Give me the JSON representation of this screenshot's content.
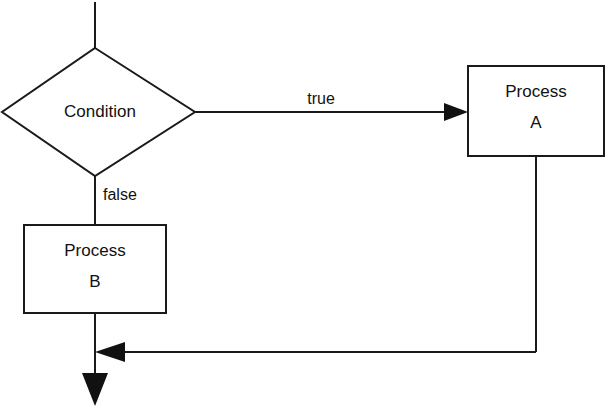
{
  "diagram": {
    "type": "flowchart",
    "colors": {
      "background": "#ffffff",
      "stroke": "#1a1a1a",
      "text": "#111111",
      "fill": "#ffffff"
    },
    "nodes": [
      {
        "id": "condition",
        "shape": "diamond",
        "label": "Condition",
        "lines": [
          "Condition"
        ],
        "center": {
          "x": 98,
          "y": 112
        },
        "width": 194,
        "height": 128
      },
      {
        "id": "process-a",
        "shape": "rectangle",
        "label": "Process A",
        "lines": [
          "Process",
          "A"
        ],
        "box": {
          "x": 468,
          "y": 66,
          "width": 136,
          "height": 90
        }
      },
      {
        "id": "process-b",
        "shape": "rectangle",
        "label": "Process B",
        "lines": [
          "Process",
          "B"
        ],
        "box": {
          "x": 24,
          "y": 225,
          "width": 142,
          "height": 88
        }
      }
    ],
    "edges": [
      {
        "id": "entry",
        "from": "start",
        "to": "condition",
        "label": "",
        "arrow": false
      },
      {
        "id": "condition-true",
        "from": "condition",
        "to": "process-a",
        "label": "true",
        "label_pos": {
          "x": 321,
          "y": 104
        },
        "arrow": true,
        "arrow_direction": "right"
      },
      {
        "id": "condition-false",
        "from": "condition",
        "to": "process-b",
        "label": "false",
        "label_pos": {
          "x": 103,
          "y": 200
        },
        "arrow": false,
        "arrow_direction": "down"
      },
      {
        "id": "process-a-merge",
        "from": "process-a",
        "to": "merge",
        "label": "",
        "arrow": true,
        "arrow_direction": "left"
      },
      {
        "id": "process-b-exit",
        "from": "process-b",
        "to": "end",
        "label": "",
        "arrow": true,
        "arrow_direction": "down"
      }
    ]
  }
}
